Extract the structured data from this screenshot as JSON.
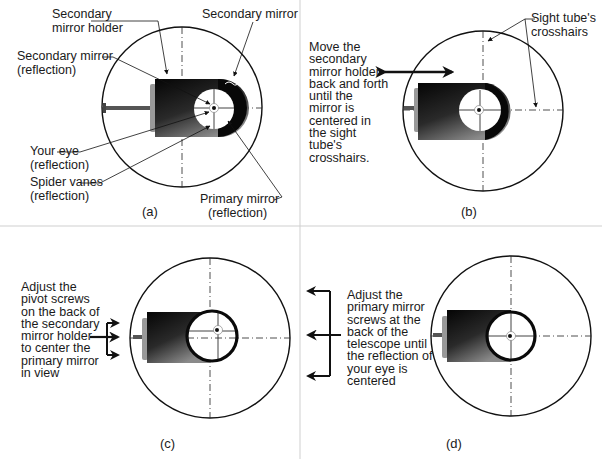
{
  "panels": {
    "a": {
      "label": "(a)",
      "annotations": {
        "secondary_mirror_holder": [
          "Secondary",
          "mirror holder"
        ],
        "secondary_mirror": "Secondary mirror",
        "secondary_mirror_reflection": [
          "Secondary mirror",
          "(reflection)"
        ],
        "your_eye_reflection": [
          "Your eye",
          "(reflection)"
        ],
        "spider_vanes_reflection": [
          "Spider vanes",
          "(reflection)"
        ],
        "primary_mirror_reflection": [
          "Primary mirror",
          "(reflection)"
        ]
      }
    },
    "b": {
      "label": "(b)",
      "instruction": [
        "Move the",
        "secondary",
        "mirror holder",
        "back and forth",
        "until the",
        "mirror is",
        "centered in",
        "the sight",
        "tube's",
        "crosshairs."
      ],
      "annotations": {
        "sight_tube_crosshairs": [
          "Sight tube's",
          "crosshairs"
        ]
      }
    },
    "c": {
      "label": "(c)",
      "instruction": [
        "Adjust the",
        "pivot screws",
        "on the back of",
        "the secondary",
        "mirror holder",
        "to center the",
        "primary mirror",
        "in view"
      ]
    },
    "d": {
      "label": "(d)",
      "instruction": [
        "Adjust the",
        "primary mirror",
        "screws at the",
        "back of the",
        "telescope until",
        "the reflection of",
        "your eye is",
        "centered"
      ]
    }
  },
  "colors": {
    "line": "#111111",
    "divider": "#c8c8c8",
    "holder_dark": "#0d0d0d",
    "holder_light": "#7a7a7a"
  }
}
